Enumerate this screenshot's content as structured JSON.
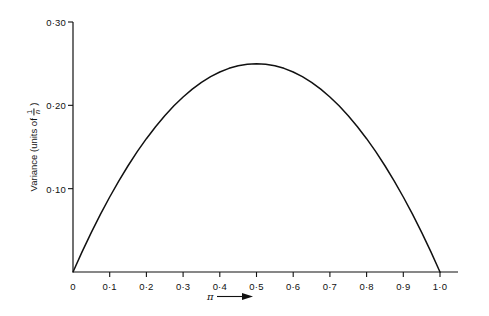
{
  "figure": {
    "background_color": "#ffffff",
    "line_color": "#111111"
  },
  "axes": {
    "y_title_prefix": "Variance (units of",
    "y_title_numerator": "1",
    "y_title_denominator": "n",
    "y_title_suffix": ")",
    "x_title_symbol": "π",
    "x_title_arrow": "arrow-right-icon",
    "y_tick_labels": [
      "0·10",
      "0·20",
      "0·30"
    ],
    "y_tick_values": [
      0.1,
      0.2,
      0.3
    ],
    "x_tick_labels": [
      "0",
      "0·1",
      "0·2",
      "0·3",
      "0·4",
      "0·5",
      "0·6",
      "0·7",
      "0·8",
      "0·9",
      "1·0"
    ],
    "x_tick_values": [
      0,
      0.1,
      0.2,
      0.3,
      0.4,
      0.5,
      0.6,
      0.7,
      0.8,
      0.9,
      1.0
    ]
  },
  "chart_data": {
    "type": "line",
    "title": "",
    "subtitle": "",
    "xlabel": "π",
    "ylabel": "Variance (units of 1/n)",
    "xlim": [
      0,
      1.0
    ],
    "ylim": [
      0,
      0.3
    ],
    "grid": false,
    "legend": null,
    "annotations": [],
    "series": [
      {
        "name": "π(1−π)",
        "formula": "y = π (1 − π)",
        "x": [
          0.0,
          0.025,
          0.05,
          0.075,
          0.1,
          0.125,
          0.15,
          0.175,
          0.2,
          0.225,
          0.25,
          0.275,
          0.3,
          0.325,
          0.35,
          0.375,
          0.4,
          0.425,
          0.45,
          0.475,
          0.5,
          0.525,
          0.55,
          0.575,
          0.6,
          0.625,
          0.65,
          0.675,
          0.7,
          0.725,
          0.75,
          0.775,
          0.8,
          0.825,
          0.85,
          0.875,
          0.9,
          0.925,
          0.95,
          0.975,
          1.0
        ],
        "values": [
          0.0,
          0.0244,
          0.0475,
          0.0694,
          0.09,
          0.1094,
          0.1275,
          0.1444,
          0.16,
          0.1744,
          0.1875,
          0.1994,
          0.21,
          0.2194,
          0.2275,
          0.2344,
          0.24,
          0.2444,
          0.2475,
          0.2494,
          0.25,
          0.2494,
          0.2475,
          0.2444,
          0.24,
          0.2344,
          0.2275,
          0.2194,
          0.21,
          0.1994,
          0.1875,
          0.1744,
          0.16,
          0.1444,
          0.1275,
          0.1094,
          0.09,
          0.0694,
          0.0475,
          0.0244,
          0.0
        ]
      }
    ],
    "peak": {
      "x": 0.5,
      "y": 0.25
    },
    "zeros": [
      0.0,
      1.0
    ]
  }
}
